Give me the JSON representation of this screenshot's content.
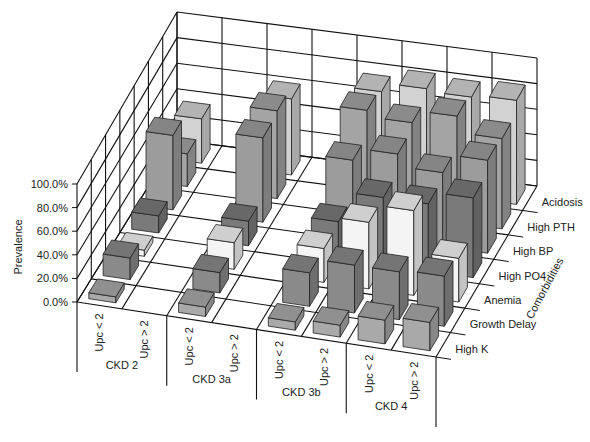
{
  "chart_data": {
    "type": "bar3d",
    "title": "",
    "ylabel": "Prevalence",
    "zlabel": "Comorbidities",
    "ylim": [
      0,
      100
    ],
    "y_ticks": [
      "0.0%",
      "20.0%",
      "40.0%",
      "60.0%",
      "80.0%",
      "100.0%"
    ],
    "groups": [
      "CKD 2",
      "CKD 3a",
      "CKD 3b",
      "CKD 4"
    ],
    "subcategories": [
      "Upc < 2",
      "Upc > 2"
    ],
    "columns": [
      "CKD 2 Upc < 2",
      "CKD 2 Upc > 2",
      "CKD 3a Upc < 2",
      "CKD 3a Upc > 2",
      "CKD 3b Upc < 2",
      "CKD 3b Upc > 2",
      "CKD 4 Upc < 2",
      "CKD 4 Upc > 2"
    ],
    "series": [
      {
        "name": "High K",
        "color": "#a9a9a9",
        "values": [
          5,
          0,
          8,
          0,
          7,
          10,
          20,
          24
        ]
      },
      {
        "name": "Growth Delay",
        "color": "#8a8a8a",
        "values": [
          18,
          0,
          17,
          0,
          28,
          40,
          40,
          42
        ]
      },
      {
        "name": "Anemia",
        "color": "#f4f4f4",
        "values": [
          5,
          0,
          22,
          0,
          28,
          55,
          70,
          36
        ]
      },
      {
        "name": "High PO4",
        "color": "#7a7a7a",
        "values": [
          14,
          0,
          20,
          0,
          30,
          55,
          55,
          65
        ]
      },
      {
        "name": "High BP",
        "color": "#9c9c9c",
        "values": [
          60,
          0,
          68,
          0,
          60,
          70,
          60,
          75
        ]
      },
      {
        "name": "High PTH",
        "color": "#a4a4a4",
        "values": [
          26,
          0,
          70,
          0,
          80,
          75,
          85,
          72
        ]
      },
      {
        "name": "Acidosis",
        "color": "#d2d2d2",
        "values": [
          35,
          0,
          60,
          0,
          75,
          82,
          80,
          82
        ]
      }
    ],
    "grid": true
  }
}
